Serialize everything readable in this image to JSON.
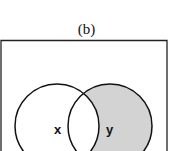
{
  "title": "(b)",
  "diagram": {
    "type": "venn",
    "sets": [
      {
        "label": "x",
        "shaded": false
      },
      {
        "label": "y",
        "shaded": true
      }
    ],
    "shaded_region": "y only (y minus x)",
    "colors": {
      "shade": "#d3d3d3",
      "stroke": "#111111",
      "background": "#ffffff"
    }
  }
}
